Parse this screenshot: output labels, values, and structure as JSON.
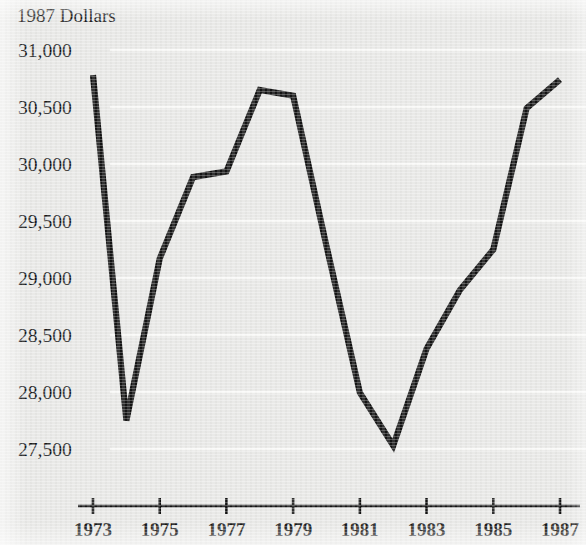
{
  "figure": {
    "background_color": "#e9e9e7",
    "ink_color": "#131313",
    "gridline_color": "#fafaf8"
  },
  "chart_data": {
    "type": "line",
    "title": "",
    "subtitle": "",
    "ylabel": "1987 Dollars",
    "xlabel": "",
    "x": [
      1973,
      1974,
      1975,
      1976,
      1977,
      1978,
      1979,
      1980,
      1981,
      1982,
      1983,
      1984,
      1985,
      1986,
      1987
    ],
    "values": [
      30780,
      27750,
      29170,
      29885,
      29935,
      30650,
      30600,
      29280,
      27995,
      27530,
      28380,
      28895,
      29250,
      30490,
      30740
    ],
    "series": [
      {
        "name": "1987 Dollars",
        "values": [
          30780,
          27750,
          29170,
          29885,
          29935,
          30650,
          30600,
          29280,
          27995,
          27530,
          28380,
          28895,
          29250,
          30490,
          30740
        ]
      }
    ],
    "ylim": [
      27350,
      31000
    ],
    "xlim": [
      1972.6,
      1987.5
    ],
    "y_ticks": [
      31000,
      30500,
      30000,
      29500,
      29000,
      28500,
      28000,
      27500
    ],
    "y_tick_labels": [
      "31,000",
      "30,500",
      "30,000",
      "29,500",
      "29,000",
      "28,500",
      "28,000",
      "27,500"
    ],
    "x_ticks": [
      1973,
      1975,
      1977,
      1979,
      1981,
      1983,
      1985,
      1987
    ],
    "x_tick_labels": [
      "1973",
      "1975",
      "1977",
      "1979",
      "1981",
      "1983",
      "1985",
      "1987"
    ],
    "grid": true,
    "grid_axis": "y",
    "legend": false,
    "legend_position": "none",
    "annotations": []
  },
  "axis": {
    "y_title": "1987 Dollars"
  }
}
